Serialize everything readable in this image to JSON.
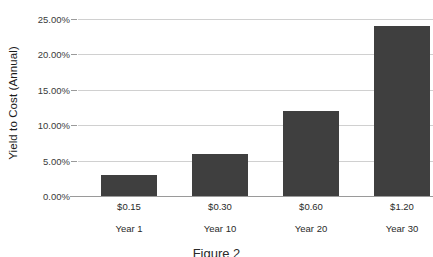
{
  "chart_data": {
    "type": "bar",
    "title": "",
    "xlabel": "",
    "ylabel": "Yield to Cost (Annual)",
    "categories": [
      "$0.15",
      "$0.30",
      "$0.60",
      "$1.20"
    ],
    "secondary_categories": [
      "Year 1",
      "Year 10",
      "Year 20",
      "Year 30"
    ],
    "values": [
      3.0,
      6.0,
      12.0,
      24.0
    ],
    "value_labels": [
      "3.00%",
      "6.00%",
      "12.00%",
      "24.00%"
    ],
    "ylim": [
      0,
      25
    ],
    "ytick_values": [
      0,
      5,
      10,
      15,
      20,
      25
    ],
    "ytick_labels": [
      "0.00%",
      "5.00%",
      "10.00%",
      "15.00%",
      "20.00%",
      "25.00%"
    ],
    "grid": true,
    "legend": false,
    "legend_position": "none",
    "bar_color": "#3f3f3f",
    "gridline_color": "#d0d0d0",
    "axis_color": "#9a9a9a",
    "background_color": "#ffffff"
  },
  "caption": {
    "text": "Figure 2"
  }
}
